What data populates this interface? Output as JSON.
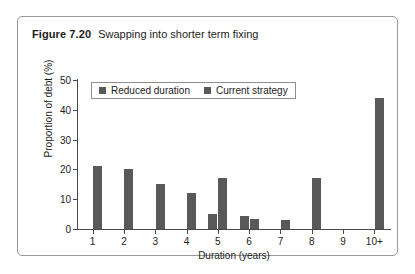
{
  "figure": {
    "label": "Figure 7.20",
    "caption": "Swapping into shorter term fixing"
  },
  "colors": {
    "bar": "#595959",
    "axis": "#4a4a4a",
    "border": "#9a9a9a",
    "text": "#1c1c1c"
  },
  "chart_data": {
    "type": "bar",
    "title": "Swapping into shorter term fixing",
    "xlabel": "Duration (years)",
    "ylabel": "Proportion of debt (%)",
    "categories": [
      "1",
      "2",
      "3",
      "4",
      "5",
      "6",
      "7",
      "8",
      "9",
      "10+"
    ],
    "series": [
      {
        "name": "Reduced duration",
        "values": [
          0,
          0,
          0,
          0,
          5,
          4.5,
          0,
          0,
          0,
          0
        ]
      },
      {
        "name": "Current strategy",
        "values": [
          21,
          20,
          15,
          12,
          17,
          3.5,
          3,
          17,
          0,
          44
        ]
      }
    ],
    "yticks": [
      0,
      10,
      20,
      30,
      40,
      50
    ],
    "ylim": [
      0,
      50
    ],
    "grid": false,
    "legend_position": "top-left"
  }
}
